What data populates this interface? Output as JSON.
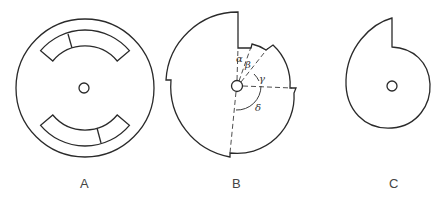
{
  "figures": [
    {
      "id": "A",
      "label": "A",
      "description": "Circular disc with central hole and two opposing arc-shaped slots, each with a divider"
    },
    {
      "id": "B",
      "label": "B",
      "description": "Stepped cam disc with central hole and angle sectors",
      "angles": [
        "α",
        "β",
        "γ",
        "δ"
      ]
    },
    {
      "id": "C",
      "label": "C",
      "description": "Spiral (snail) cam with central hole and a single step"
    }
  ],
  "colors": {
    "stroke": "#2a2a2a",
    "background": "#ffffff"
  }
}
